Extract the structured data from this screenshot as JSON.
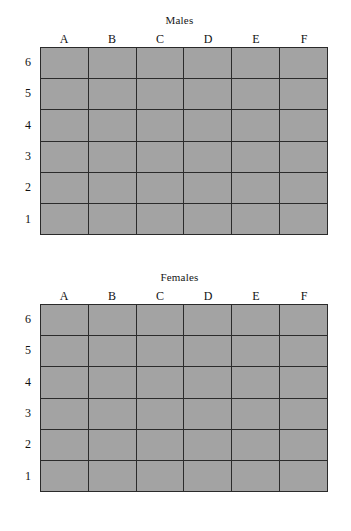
{
  "figure": {
    "background_color": "#ffffff",
    "cell_fill_color": "#a3a3a3",
    "grid_line_color": "#2b2b2b",
    "text_color": "#111111"
  },
  "panels": [
    {
      "title": "Males",
      "column_labels": [
        "A",
        "B",
        "C",
        "D",
        "E",
        "F"
      ],
      "row_labels": [
        "6",
        "5",
        "4",
        "3",
        "2",
        "1"
      ],
      "cells": [
        [
          "",
          "",
          "",
          "",
          "",
          ""
        ],
        [
          "",
          "",
          "",
          "",
          "",
          ""
        ],
        [
          "",
          "",
          "",
          "",
          "",
          ""
        ],
        [
          "",
          "",
          "",
          "",
          "",
          ""
        ],
        [
          "",
          "",
          "",
          "",
          "",
          ""
        ],
        [
          "",
          "",
          "",
          "",
          "",
          ""
        ]
      ]
    },
    {
      "title": "Females",
      "column_labels": [
        "A",
        "B",
        "C",
        "D",
        "E",
        "F"
      ],
      "row_labels": [
        "6",
        "5",
        "4",
        "3",
        "2",
        "1"
      ],
      "cells": [
        [
          "",
          "",
          "",
          "",
          "",
          ""
        ],
        [
          "",
          "",
          "",
          "",
          "",
          ""
        ],
        [
          "",
          "",
          "",
          "",
          "",
          ""
        ],
        [
          "",
          "",
          "",
          "",
          "",
          ""
        ],
        [
          "",
          "",
          "",
          "",
          "",
          ""
        ],
        [
          "",
          "",
          "",
          "",
          "",
          ""
        ]
      ]
    }
  ],
  "chart_data": {
    "type": "heatmap",
    "title": "",
    "subtitle": "",
    "xlabel": "",
    "ylabel": "",
    "grid": true,
    "legend": "none",
    "panels": [
      {
        "name": "Males",
        "x": [
          "A",
          "B",
          "C",
          "D",
          "E",
          "F"
        ],
        "y": [
          "6",
          "5",
          "4",
          "3",
          "2",
          "1"
        ],
        "values": [
          [
            null,
            null,
            null,
            null,
            null,
            null
          ],
          [
            null,
            null,
            null,
            null,
            null,
            null
          ],
          [
            null,
            null,
            null,
            null,
            null,
            null
          ],
          [
            null,
            null,
            null,
            null,
            null,
            null
          ],
          [
            null,
            null,
            null,
            null,
            null,
            null
          ],
          [
            null,
            null,
            null,
            null,
            null,
            null
          ]
        ]
      },
      {
        "name": "Females",
        "x": [
          "A",
          "B",
          "C",
          "D",
          "E",
          "F"
        ],
        "y": [
          "6",
          "5",
          "4",
          "3",
          "2",
          "1"
        ],
        "values": [
          [
            null,
            null,
            null,
            null,
            null,
            null
          ],
          [
            null,
            null,
            null,
            null,
            null,
            null
          ],
          [
            null,
            null,
            null,
            null,
            null,
            null
          ],
          [
            null,
            null,
            null,
            null,
            null,
            null
          ],
          [
            null,
            null,
            null,
            null,
            null,
            null
          ],
          [
            null,
            null,
            null,
            null,
            null,
            null
          ]
        ]
      }
    ]
  }
}
